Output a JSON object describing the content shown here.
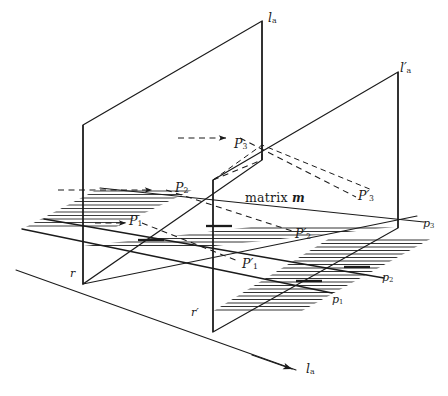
{
  "figure": {
    "type": "3d-geometric-projection-diagram",
    "background_color": "#ffffff",
    "stroke_color": "#1b1b1b"
  },
  "labels": {
    "plane_front": "l",
    "plane_front_sub": "a",
    "plane_back": "l",
    "plane_back_prime": "′",
    "plane_back_sub": "a",
    "axis": "l",
    "axis_sub": "a",
    "matrix_text": "matrix",
    "matrix_var": "m",
    "origin_front": "r",
    "origin_back": "r",
    "origin_back_prime": "′",
    "points_front": [
      {
        "name": "P",
        "sub": "1"
      },
      {
        "name": "P",
        "sub": "2"
      },
      {
        "name": "P",
        "sub": "3"
      }
    ],
    "points_back": [
      {
        "name": "P",
        "prime": "′",
        "sub": "1"
      },
      {
        "name": "P",
        "prime": "′",
        "sub": "2"
      },
      {
        "name": "P",
        "prime": "′",
        "sub": "3"
      }
    ],
    "rays": [
      {
        "name": "p",
        "sub": "1"
      },
      {
        "name": "p",
        "sub": "2"
      },
      {
        "name": "p",
        "sub": "3"
      }
    ]
  },
  "geometry": {
    "hatch_line_count_left": 14,
    "hatch_line_count_right": 16,
    "ray_count": 3,
    "arrow_count": 4
  }
}
